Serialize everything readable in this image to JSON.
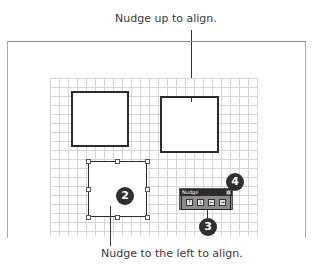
{
  "captions": {
    "top": "Nudge up to align.",
    "bottom": "Nudge to the left to align."
  },
  "nudge_toolbar": {
    "title": "Nudge",
    "buttons": [
      {
        "name": "nudge-up",
        "glyph": "↑"
      },
      {
        "name": "nudge-down",
        "glyph": "↓"
      },
      {
        "name": "nudge-left",
        "glyph": "←"
      },
      {
        "name": "nudge-right",
        "glyph": "→"
      }
    ]
  },
  "badges": {
    "two": "2",
    "three": "3",
    "four": "4"
  },
  "colors": {
    "badge": "#2f2f2f",
    "grid_line": "#d6d6d6",
    "shape_border": "#2b2b2b",
    "toolbar_title": "#2c2c2c"
  }
}
